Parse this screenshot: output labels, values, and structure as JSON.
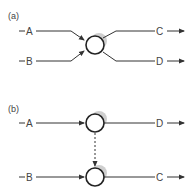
{
  "panels": [
    {
      "label": "(a)",
      "inputs": [
        "A",
        "B"
      ],
      "outputs": [
        "C",
        "D"
      ]
    },
    {
      "label": "(b)",
      "top": {
        "input": "A",
        "output": "D"
      },
      "bottom": {
        "input": "B",
        "output": "C"
      }
    }
  ],
  "colors": {
    "line": "#333333",
    "shadow": "#c8c8c8"
  }
}
